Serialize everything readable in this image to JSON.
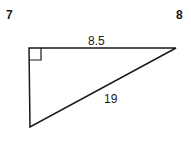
{
  "problem_numbers": {
    "left": "7",
    "right": "8"
  },
  "triangle": {
    "top_side_label": "8.5",
    "hypotenuse_label": "19",
    "right_angle_marker": "right-angle-square",
    "vertices": {
      "top_left": [
        29,
        48
      ],
      "top_right": [
        176,
        48
      ],
      "bottom": [
        30,
        127
      ]
    }
  },
  "colors": {
    "line": "#1a1a1a",
    "background": "#ffffff"
  }
}
